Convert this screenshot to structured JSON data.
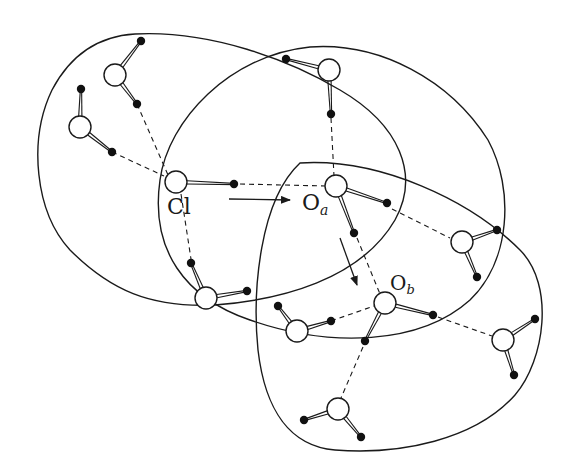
{
  "diagram": {
    "type": "hydrogen-bond network / solvation shells",
    "labels": {
      "cl": "Cl",
      "oa_main": "O",
      "oa_sub": "a",
      "ob_main": "O",
      "ob_sub": "b"
    },
    "colors": {
      "stroke": "#1a1a1a",
      "background": "#ffffff",
      "oxygen_fill": "#ffffff",
      "hydrogen_fill": "#111111"
    },
    "shells": [
      {
        "id": "shell-cl",
        "around": "Cl"
      },
      {
        "id": "shell-oa",
        "around": "Oa"
      },
      {
        "id": "shell-ob",
        "around": "Ob"
      }
    ],
    "arrows": [
      {
        "id": "arrow-cl-to-oa",
        "from": "Cl",
        "to": "Oa"
      },
      {
        "id": "arrow-oa-to-ob",
        "from": "Oa",
        "to": "Ob"
      }
    ],
    "molecules": [
      {
        "id": "water-1",
        "o": [
          115,
          75
        ],
        "h": [
          [
            141,
            41
          ],
          [
            137,
            104
          ]
        ]
      },
      {
        "id": "water-2",
        "o": [
          80,
          127
        ],
        "h": [
          [
            81,
            89
          ],
          [
            112,
            152
          ]
        ]
      },
      {
        "id": "chloride",
        "o": [
          176,
          182
        ],
        "h": [
          [
            234,
            184
          ]
        ]
      },
      {
        "id": "water-top",
        "o": [
          329,
          70
        ],
        "h": [
          [
            286,
            59
          ],
          [
            331,
            114
          ]
        ]
      },
      {
        "id": "water-oa",
        "o": [
          336,
          186
        ],
        "h": [
          [
            387,
            203
          ],
          [
            354,
            233
          ]
        ]
      },
      {
        "id": "water-right-upper",
        "o": [
          462,
          242
        ],
        "h": [
          [
            497,
            230
          ],
          [
            477,
            277
          ]
        ]
      },
      {
        "id": "water-left-lower",
        "o": [
          206,
          298
        ],
        "h": [
          [
            191,
            263
          ],
          [
            247,
            291
          ]
        ]
      },
      {
        "id": "water-mid-lower",
        "o": [
          297,
          331
        ],
        "h": [
          [
            278,
            306
          ],
          [
            331,
            321
          ]
        ]
      },
      {
        "id": "water-ob",
        "o": [
          385,
          303
        ],
        "h": [
          [
            433,
            315
          ],
          [
            365,
            341
          ]
        ]
      },
      {
        "id": "water-right-lower",
        "o": [
          503,
          340
        ],
        "h": [
          [
            535,
            319
          ],
          [
            514,
            375
          ]
        ]
      },
      {
        "id": "water-bottom",
        "o": [
          338,
          409
        ],
        "h": [
          [
            304,
            420
          ],
          [
            361,
            437
          ]
        ]
      }
    ]
  }
}
